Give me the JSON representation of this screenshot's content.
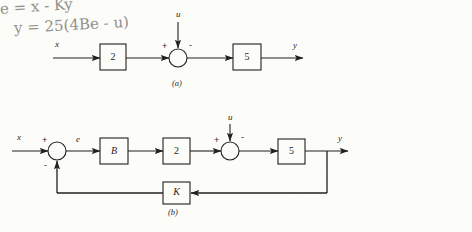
{
  "page": {
    "background_color": "#fdfdfa",
    "ink_color": "#1f1d1b",
    "pencil_color": "#918f88",
    "width": 472,
    "height": 232
  },
  "figure_a": {
    "caption": "(a)",
    "input_label": "x",
    "disturbance_label": "u",
    "output_label": "y",
    "gain_block_1": "2",
    "gain_block_2": "5",
    "sum_plus": "+",
    "sum_minus": "-"
  },
  "figure_b": {
    "caption": "(b)",
    "input_label": "x",
    "error_label": "e",
    "disturbance_label": "u",
    "output_label": "y",
    "block_b": "B",
    "block_gain_2": "2",
    "block_gain_5": "5",
    "feedback_block": "K",
    "sum1_plus": "+",
    "sum1_minus": "-",
    "sum2_plus": "+",
    "sum2_minus": "-"
  },
  "annotation": {
    "line_1": "e = x - Ky",
    "line_2": "y = 25(4Be - u)"
  }
}
